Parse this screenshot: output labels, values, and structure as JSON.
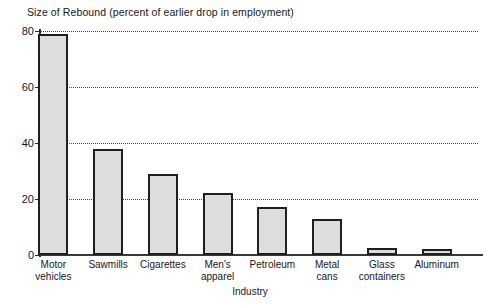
{
  "chart_data": {
    "type": "bar",
    "title": "Size of Rebound (percent of earlier drop in employment)",
    "xlabel": "Industry",
    "ylabel": "",
    "ylim": [
      0,
      80
    ],
    "yticks": [
      0,
      20,
      40,
      60,
      80
    ],
    "ytick_labels": [
      "0",
      "20",
      "40",
      "60",
      "80"
    ],
    "grid": true,
    "legend": null,
    "categories": [
      "Motor vehicles",
      "Sawmills",
      "Cigarettes",
      "Men's apparel",
      "Petroleum",
      "Metal cans",
      "Glass containers",
      "Aluminum"
    ],
    "category_lines": [
      [
        "Motor",
        "vehicles"
      ],
      [
        "Sawmills",
        ""
      ],
      [
        "Cigarettes",
        ""
      ],
      [
        "Men's",
        "apparel"
      ],
      [
        "Petroleum",
        ""
      ],
      [
        "Metal",
        "cans"
      ],
      [
        "Glass",
        "containers"
      ],
      [
        "Aluminum",
        ""
      ]
    ],
    "values": [
      79,
      38,
      29,
      22,
      17,
      13,
      2.5,
      2
    ],
    "bar_fill_color": "#dddddd",
    "bar_edge_color": "#1f1f1f",
    "axis_color": "#2a2a2a",
    "gridline_color": "#4a4a4a",
    "background_color": "#ffffff"
  }
}
